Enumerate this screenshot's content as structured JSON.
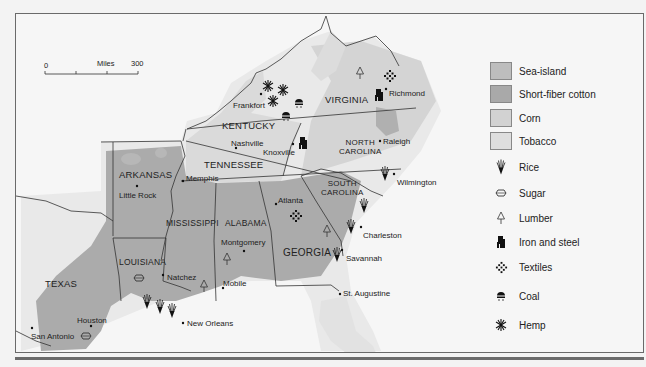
{
  "map": {
    "scale": {
      "start": "0",
      "unit": "Miles",
      "end": "300"
    },
    "states": [
      {
        "name": "VIRGINIA"
      },
      {
        "name": "KENTUCKY"
      },
      {
        "name": "TENNESSEE"
      },
      {
        "name": "NORTH CAROLINA",
        "line1": "NORTH",
        "line2": "CAROLINA"
      },
      {
        "name": "SOUTH CAROLINA",
        "line1": "SOUTH",
        "line2": "CAROLINA"
      },
      {
        "name": "ARKANSAS"
      },
      {
        "name": "MISSISSIPPI"
      },
      {
        "name": "ALABAMA"
      },
      {
        "name": "GEORGIA"
      },
      {
        "name": "LOUISIANA"
      },
      {
        "name": "TEXAS"
      },
      {
        "name": "FLORIDA"
      }
    ],
    "cities": [
      {
        "name": "Richmond"
      },
      {
        "name": "Frankfort"
      },
      {
        "name": "Nashville"
      },
      {
        "name": "Knoxville"
      },
      {
        "name": "Raleigh"
      },
      {
        "name": "Memphis"
      },
      {
        "name": "Little Rock"
      },
      {
        "name": "Wilmington"
      },
      {
        "name": "Atlanta"
      },
      {
        "name": "Charleston"
      },
      {
        "name": "Montgomery"
      },
      {
        "name": "Savannah"
      },
      {
        "name": "Natchez"
      },
      {
        "name": "Mobile"
      },
      {
        "name": "St. Augustine"
      },
      {
        "name": "Houston"
      },
      {
        "name": "San Antonio"
      },
      {
        "name": "New Orleans"
      }
    ]
  },
  "legend": {
    "areas": [
      {
        "label": "Sea-island",
        "color": "#bdbdbd"
      },
      {
        "label": "Short-fiber cotton",
        "color": "#a9a9a9"
      },
      {
        "label": "Corn",
        "color": "#d2d2d2"
      },
      {
        "label": "Tobacco",
        "color": "#dedede"
      }
    ],
    "symbols": [
      {
        "label": "Rice",
        "icon": "rice-icon"
      },
      {
        "label": "Sugar",
        "icon": "sugar-icon"
      },
      {
        "label": "Lumber",
        "icon": "lumber-icon"
      },
      {
        "label": "Iron and steel",
        "icon": "iron-steel-icon"
      },
      {
        "label": "Textiles",
        "icon": "textiles-icon"
      },
      {
        "label": "Coal",
        "icon": "coal-icon"
      },
      {
        "label": "Hemp",
        "icon": "hemp-icon"
      }
    ]
  },
  "colors": {
    "background": "#f6f6f6",
    "cotton": "#a9a9a9",
    "corn": "#d2d2d2",
    "tobacco": "#dedede",
    "border": "#333333"
  }
}
